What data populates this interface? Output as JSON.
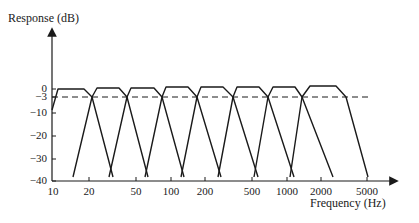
{
  "chart_data": {
    "type": "line",
    "title": "",
    "ylabel": "Response (dB)",
    "xlabel": "Frequency (Hz)",
    "xscale": "log",
    "xlim": [
      10,
      5000
    ],
    "ylim": [
      -40,
      0
    ],
    "grid": false,
    "legend": null,
    "y_ticks": [
      {
        "value": 0,
        "label": "0",
        "py": 89
      },
      {
        "value": -3,
        "label": "−3",
        "py": 97
      },
      {
        "value": -10,
        "label": "−10",
        "py": 113
      },
      {
        "value": -20,
        "label": "−20",
        "py": 136
      },
      {
        "value": -30,
        "label": "−30",
        "py": 159
      },
      {
        "value": -40,
        "label": "−40",
        "py": 181
      }
    ],
    "x_ticks": [
      {
        "value": 10,
        "label": "10",
        "px": 53
      },
      {
        "value": 20,
        "label": "20",
        "px": 89
      },
      {
        "value": 50,
        "label": "50",
        "px": 136
      },
      {
        "value": 100,
        "label": "100",
        "px": 171
      },
      {
        "value": 200,
        "label": "200",
        "px": 205
      },
      {
        "value": 500,
        "label": "500",
        "px": 252
      },
      {
        "value": 1000,
        "label": "1000",
        "px": 287
      },
      {
        "value": 2000,
        "label": "2000",
        "px": 321
      },
      {
        "value": 5000,
        "label": "5000",
        "px": 367
      }
    ],
    "reference_line": {
      "value": -3,
      "style": "dashed",
      "label": "−3 dB"
    },
    "annotation": "Bank of 8 overlapping bandpass filters, adjacent bands cross at −3 dB",
    "series": [
      {
        "name": "band 1",
        "points": [
          [
            52,
            110
          ],
          [
            58,
            89
          ],
          [
            84,
            89
          ],
          [
            92,
            97
          ],
          [
            113,
            177
          ]
        ]
      },
      {
        "name": "band 2",
        "points": [
          [
            73,
            177
          ],
          [
            92,
            97
          ],
          [
            97,
            88
          ],
          [
            119,
            88
          ],
          [
            127,
            97
          ],
          [
            148,
            177
          ]
        ]
      },
      {
        "name": "band 3",
        "points": [
          [
            109,
            177
          ],
          [
            127,
            97
          ],
          [
            131,
            88
          ],
          [
            154,
            88
          ],
          [
            162,
            97
          ],
          [
            184,
            177
          ]
        ]
      },
      {
        "name": "band 4",
        "points": [
          [
            145,
            177
          ],
          [
            162,
            97
          ],
          [
            166,
            87
          ],
          [
            188,
            87
          ],
          [
            197,
            97
          ],
          [
            221,
            177
          ]
        ]
      },
      {
        "name": "band 5",
        "points": [
          [
            181,
            177
          ],
          [
            197,
            97
          ],
          [
            201,
            87
          ],
          [
            223,
            87
          ],
          [
            233,
            97
          ],
          [
            258,
            177
          ]
        ]
      },
      {
        "name": "band 6",
        "points": [
          [
            218,
            177
          ],
          [
            233,
            97
          ],
          [
            237,
            87
          ],
          [
            259,
            87
          ],
          [
            268,
            97
          ],
          [
            294,
            177
          ]
        ]
      },
      {
        "name": "band 7",
        "points": [
          [
            254,
            177
          ],
          [
            268,
            97
          ],
          [
            273,
            87
          ],
          [
            295,
            87
          ],
          [
            302,
            97
          ],
          [
            333,
            177
          ]
        ]
      },
      {
        "name": "band 8",
        "points": [
          [
            290,
            177
          ],
          [
            302,
            97
          ],
          [
            310,
            86
          ],
          [
            336,
            86
          ],
          [
            346,
            97
          ],
          [
            368,
            177
          ]
        ]
      }
    ]
  }
}
